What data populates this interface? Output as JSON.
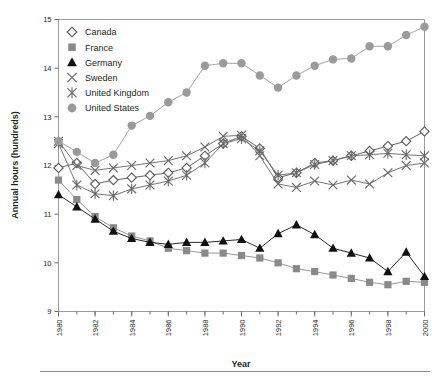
{
  "figure": {
    "xlabel": "Year",
    "ylabel": "Annual hours (hundreds)"
  },
  "chart_data": {
    "type": "line",
    "title": "",
    "xlabel": "Year",
    "ylabel": "Annual hours (hundreds)",
    "xlim": [
      1980,
      2000
    ],
    "ylim": [
      9,
      15
    ],
    "yticks": [
      9,
      10,
      11,
      12,
      13,
      14,
      15
    ],
    "xticks": [
      1980,
      1982,
      1984,
      1986,
      1988,
      1990,
      1992,
      1994,
      1996,
      1998,
      2000
    ],
    "xtick_minor_every": 1,
    "grid": false,
    "legend_position": "upper-left-inside",
    "x": [
      1980,
      1981,
      1982,
      1983,
      1984,
      1985,
      1986,
      1987,
      1988,
      1989,
      1990,
      1991,
      1992,
      1993,
      1994,
      1995,
      1996,
      1997,
      1998,
      1999,
      2000
    ],
    "series": [
      {
        "name": "Canada",
        "marker": "open-diamond",
        "color": "#555555",
        "values": [
          11.95,
          12.05,
          11.62,
          11.7,
          11.75,
          11.8,
          11.85,
          11.95,
          12.2,
          12.45,
          12.6,
          12.35,
          11.75,
          11.85,
          12.05,
          12.1,
          12.2,
          12.3,
          12.4,
          12.5,
          12.7
        ]
      },
      {
        "name": "France",
        "marker": "filled-square",
        "color": "#8a8a8a",
        "values": [
          11.7,
          11.3,
          10.95,
          10.72,
          10.55,
          10.45,
          10.3,
          10.25,
          10.2,
          10.2,
          10.15,
          10.1,
          10.0,
          9.88,
          9.82,
          9.75,
          9.68,
          9.6,
          9.55,
          9.62,
          9.6
        ]
      },
      {
        "name": "Germany",
        "marker": "filled-triangle",
        "color": "#111111",
        "values": [
          11.4,
          11.15,
          10.9,
          10.65,
          10.5,
          10.42,
          10.38,
          10.42,
          10.42,
          10.45,
          10.48,
          10.3,
          10.6,
          10.78,
          10.58,
          10.3,
          10.2,
          10.1,
          9.82,
          10.22,
          9.72
        ]
      },
      {
        "name": "Sweden",
        "marker": "cross",
        "color": "#666666",
        "values": [
          12.5,
          12.0,
          11.9,
          11.95,
          12.0,
          12.05,
          12.1,
          12.2,
          12.38,
          12.6,
          12.62,
          12.2,
          11.62,
          11.55,
          11.68,
          11.6,
          11.7,
          11.62,
          11.85,
          12.0,
          12.05
        ]
      },
      {
        "name": "United Kingdom",
        "marker": "asterisk",
        "color": "#666666",
        "values": [
          12.45,
          11.6,
          11.42,
          11.38,
          11.52,
          11.6,
          11.68,
          11.8,
          12.05,
          12.45,
          12.55,
          12.3,
          11.8,
          11.85,
          12.02,
          12.1,
          12.2,
          12.22,
          12.25,
          12.22,
          12.2
        ]
      },
      {
        "name": "United States",
        "marker": "filled-circle",
        "color": "#9a9a9a",
        "values": [
          12.5,
          12.28,
          12.05,
          12.22,
          12.82,
          13.02,
          13.3,
          13.5,
          14.05,
          14.1,
          14.1,
          13.85,
          13.6,
          13.85,
          14.05,
          14.18,
          14.2,
          14.45,
          14.45,
          14.68,
          14.85
        ]
      }
    ]
  },
  "legend": {
    "items": [
      {
        "label": "Canada",
        "marker": "open-diamond"
      },
      {
        "label": "France",
        "marker": "filled-square"
      },
      {
        "label": "Germany",
        "marker": "filled-triangle"
      },
      {
        "label": "Sweden",
        "marker": "cross"
      },
      {
        "label": "United Kingdom",
        "marker": "asterisk"
      },
      {
        "label": "United States",
        "marker": "filled-circle"
      }
    ]
  }
}
